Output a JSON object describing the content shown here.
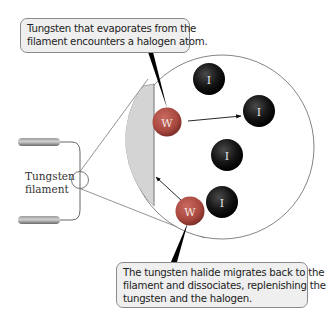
{
  "callouts": {
    "top": {
      "lines": [
        "Tungsten that evaporates from the",
        "filament encounters a halogen atom."
      ]
    },
    "bottom": {
      "lines": [
        "The tungsten halide migrates back to the",
        "filament and dissociates, replenishing the",
        "tungsten and the halogen."
      ]
    }
  },
  "filament_label": {
    "lines": [
      "Tungsten",
      "filament"
    ]
  },
  "atoms": {
    "tungsten_symbol": "W",
    "halogen_symbol": "I",
    "tungsten_color": "#b0574f",
    "halogen_color": "#1a1a1a"
  },
  "colors": {
    "filament_wedge": "#d4d4d4",
    "callout_bg": "#efefef",
    "outline": "#7a7a7a"
  }
}
